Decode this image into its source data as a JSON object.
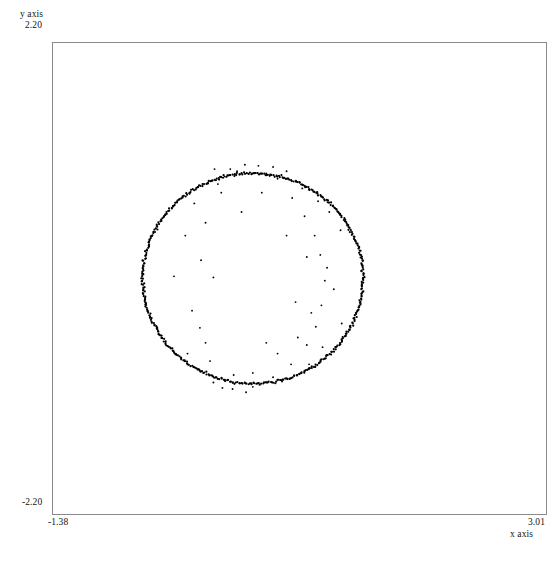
{
  "figure": {
    "background_color": "#ffffff",
    "frame_color": "#8a8a8a",
    "point_color": "#000000"
  },
  "axes": {
    "y_axis_title": "y axis",
    "y_axis_max_label": "2.20",
    "y_axis_min_label": "-2.20",
    "x_axis_title": "x axis",
    "x_axis_min_label": "-1.38",
    "x_axis_max_label": "3.01"
  },
  "chart_data": {
    "type": "scatter",
    "title": "",
    "xlabel": "x axis",
    "ylabel": "y axis",
    "xlim": [
      -1.38,
      3.01
    ],
    "ylim": [
      -2.2,
      2.2
    ],
    "grid": false,
    "legend": "none",
    "marker": "point",
    "marker_size_px": 1.1,
    "series": [
      {
        "name": "circle-inliers",
        "description": "Dense ring of points lying on a circle",
        "shape": "circle",
        "center": [
          0.4,
          0.0
        ],
        "radius": 0.98,
        "n_points": 520
      },
      {
        "name": "outliers",
        "description": "Sparse uniformly scattered noise points",
        "points": [
          [
            -0.02,
            0.52
          ],
          [
            -0.06,
            0.17
          ],
          [
            -0.07,
            -0.46
          ],
          [
            0.02,
            -0.77
          ],
          [
            0.09,
            0.88
          ],
          [
            0.13,
            -1.02
          ],
          [
            0.2,
            1.02
          ],
          [
            0.33,
            1.06
          ],
          [
            0.45,
            1.05
          ],
          [
            0.52,
            0.98
          ],
          [
            0.62,
            0.93
          ],
          [
            0.75,
            0.75
          ],
          [
            0.86,
            0.58
          ],
          [
            0.95,
            0.4
          ],
          [
            1.0,
            0.22
          ],
          [
            1.04,
            -0.02
          ],
          [
            1.01,
            -0.25
          ],
          [
            0.96,
            -0.45
          ],
          [
            0.88,
            -0.62
          ],
          [
            0.74,
            -0.8
          ],
          [
            0.58,
            -0.92
          ],
          [
            0.4,
            -1.01
          ],
          [
            0.22,
            -1.03
          ],
          [
            0.05,
            -0.97
          ],
          [
            -0.09,
            -0.85
          ],
          [
            -0.18,
            -0.7
          ],
          [
            1.18,
            0.45
          ],
          [
            1.19,
            -0.42
          ],
          [
            0.7,
            0.4
          ],
          [
            0.05,
            0.01
          ],
          [
            -0.3,
            0.02
          ],
          [
            0.8,
            -0.55
          ],
          [
            0.62,
            -0.7
          ],
          [
            0.3,
            0.62
          ],
          [
            0.88,
            0.2
          ],
          [
            0.52,
            -0.6
          ],
          [
            -0.12,
            0.7
          ],
          [
            0.15,
            0.95
          ],
          [
            1.08,
            0.62
          ],
          [
            0.98,
            0.72
          ],
          [
            0.4,
            -0.88
          ],
          [
            0.23,
            -0.9
          ],
          [
            -0.02,
            -0.6
          ],
          [
            0.92,
            -0.32
          ],
          [
            1.06,
            0.1
          ],
          [
            0.7,
            1.0
          ],
          [
            0.58,
            1.04
          ],
          [
            0.34,
            -1.06
          ],
          [
            0.12,
            0.8
          ],
          [
            -0.14,
            -0.3
          ],
          [
            0.84,
            0.84
          ],
          [
            0.48,
            0.8
          ],
          [
            1.02,
            -0.64
          ],
          [
            0.66,
            -0.96
          ],
          [
            0.06,
            1.02
          ],
          [
            -0.2,
            0.4
          ],
          [
            0.9,
            -0.8
          ],
          [
            1.12,
            -0.1
          ],
          [
            0.26,
            1.0
          ],
          [
            0.78,
            -0.22
          ]
        ],
        "n_points": 60
      }
    ]
  }
}
